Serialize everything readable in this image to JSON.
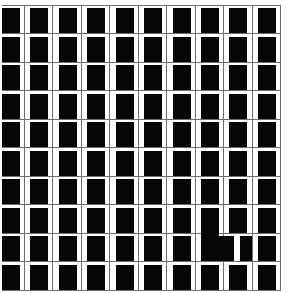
{
  "figure": {
    "background_color": "#ffffff",
    "square_color": "#060606",
    "line_color": "#6e6e6e"
  },
  "grid": {
    "columns": 10,
    "rows": 10,
    "col_pitch": 28.45,
    "row_pitch": 28.5,
    "square_width": 18,
    "square_height": 25,
    "square_left_start": 1.8,
    "v_line_x_start": 23.9,
    "h_line_y_start": 4.5,
    "h_line_x1": 2,
    "h_line_x2": 280.5,
    "v_line_y1": 4.5,
    "v_line_y2": 289.5,
    "line_thickness": 1
  },
  "anomaly": {
    "location_label": "rows 8-9, column 8",
    "skip_default_cells": [
      {
        "row": 8,
        "col": 7
      },
      {
        "row": 8,
        "col": 8
      }
    ],
    "connector_rect": {
      "x": 200.9,
      "y": 231.5,
      "w": 18,
      "h": 6
    },
    "enlarged_square": {
      "x": 200.9,
      "y": 236,
      "w": 33.2,
      "h": 25
    },
    "narrowed_square": {
      "x": 240,
      "y": 236,
      "w": 11.5,
      "h": 25
    }
  }
}
